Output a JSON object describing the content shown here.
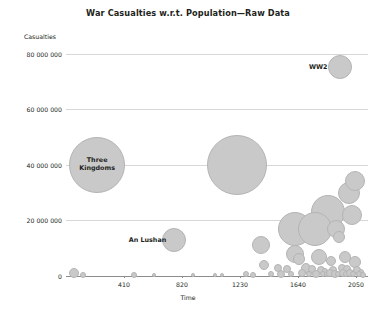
{
  "chart_data": {
    "type": "scatter",
    "title": "War Casualties w.r.t. Population—Raw Data",
    "xlabel": "Time",
    "ylabel": "Casualties",
    "xlim": [
      0,
      2135
    ],
    "ylim": [
      0,
      82000000
    ],
    "grid": true,
    "legend": "none",
    "xticks": [
      410,
      820,
      1230,
      1640,
      2050
    ],
    "xtick_labels": [
      "410",
      "820",
      "1230",
      "1640",
      "2050"
    ],
    "yticks": [
      0,
      20000000,
      40000000,
      60000000,
      80000000
    ],
    "ytick_labels": [
      "0",
      "20 000 000",
      "40 000 000",
      "60 000 000",
      "80 000 000"
    ],
    "marker": "bubble",
    "annotations": [
      {
        "label": "Three\nKingdoms",
        "x": 220,
        "y": 40000000
      },
      {
        "label": "An Lushan",
        "x": 760,
        "y": 13000000
      },
      {
        "label": "WW2",
        "x": 1939,
        "y": 75000000
      }
    ],
    "points": [
      {
        "x": 220,
        "y": 40000000,
        "r": 28,
        "name": "Three Kingdoms"
      },
      {
        "x": 1206,
        "y": 40000000,
        "r": 30,
        "name": "Mongol Conquests"
      },
      {
        "x": 1939,
        "y": 75000000,
        "r": 12,
        "name": "WW2"
      },
      {
        "x": 1850,
        "y": 23000000,
        "r": 17,
        "name": "Taiping Rebellion"
      },
      {
        "x": 1616,
        "y": 17000000,
        "r": 17,
        "name": "Qing conquest of Ming"
      },
      {
        "x": 1760,
        "y": 17000000,
        "r": 17,
        "name": "Dungan Revolt"
      },
      {
        "x": 2000,
        "y": 30000000,
        "r": 11,
        "name": "Cluster A"
      },
      {
        "x": 2040,
        "y": 34000000,
        "r": 10,
        "name": "Cluster B"
      },
      {
        "x": 2020,
        "y": 22000000,
        "r": 10,
        "name": "Cluster C"
      },
      {
        "x": 760,
        "y": 13000000,
        "r": 12,
        "name": "An Lushan"
      },
      {
        "x": 1910,
        "y": 17000000,
        "r": 9,
        "name": "WW1"
      },
      {
        "x": 1930,
        "y": 14000000,
        "r": 6,
        "name": "Russian Civil War"
      },
      {
        "x": 1620,
        "y": 8000000,
        "r": 9,
        "name": "Thirty Years War"
      },
      {
        "x": 1790,
        "y": 7000000,
        "r": 8,
        "name": "Napoleonic Wars"
      },
      {
        "x": 1650,
        "y": 6000000,
        "r": 6,
        "name": "Conquest of the Americas"
      },
      {
        "x": 1870,
        "y": 5500000,
        "r": 5,
        "name": "Colonial Wars"
      },
      {
        "x": 1975,
        "y": 7000000,
        "r": 6,
        "name": "Chinese Civil War"
      },
      {
        "x": 2045,
        "y": 5000000,
        "r": 6,
        "name": "Modern Conflict"
      },
      {
        "x": 1380,
        "y": 11000000,
        "r": 9,
        "name": "Timur"
      },
      {
        "x": 1400,
        "y": 4000000,
        "r": 5,
        "name": "Late Medieval"
      },
      {
        "x": 1500,
        "y": 3000000,
        "r": 4,
        "name": "Italian Wars"
      },
      {
        "x": 1560,
        "y": 2500000,
        "r": 4,
        "name": "French Wars of Religion"
      },
      {
        "x": 1700,
        "y": 3000000,
        "r": 5,
        "name": "War of Spanish Succession"
      },
      {
        "x": 1740,
        "y": 2500000,
        "r": 4,
        "name": "Seven Years War"
      },
      {
        "x": 1800,
        "y": 2000000,
        "r": 4,
        "name": "Latin Independence"
      },
      {
        "x": 1830,
        "y": 1800000,
        "r": 3,
        "name": "Crimean War"
      },
      {
        "x": 1890,
        "y": 2200000,
        "r": 4,
        "name": "Boxer Rebellion"
      },
      {
        "x": 1950,
        "y": 3000000,
        "r": 4,
        "name": "Korean War"
      },
      {
        "x": 1990,
        "y": 2500000,
        "r": 4,
        "name": "Vietnam War"
      },
      {
        "x": 2060,
        "y": 2000000,
        "r": 4,
        "name": "Recent Conflict"
      },
      {
        "x": 2085,
        "y": 1500000,
        "r": 3,
        "name": "Contemporary"
      },
      {
        "x": 60,
        "y": 1000000,
        "r": 5,
        "name": "Roman Wars"
      },
      {
        "x": 120,
        "y": 400000,
        "r": 3,
        "name": "Antiquity"
      },
      {
        "x": 480,
        "y": 500000,
        "r": 3,
        "name": "Migration Period"
      },
      {
        "x": 620,
        "y": 400000,
        "r": 2,
        "name": "Early Medieval"
      },
      {
        "x": 900,
        "y": 300000,
        "r": 2,
        "name": "Viking Age"
      },
      {
        "x": 1050,
        "y": 300000,
        "r": 2,
        "name": "Crusades"
      },
      {
        "x": 1100,
        "y": 300000,
        "r": 2,
        "name": "Reconquista"
      },
      {
        "x": 1270,
        "y": 600000,
        "r": 3,
        "name": "Hundred Years War"
      },
      {
        "x": 1320,
        "y": 500000,
        "r": 3,
        "name": "Medieval Conflict"
      },
      {
        "x": 1450,
        "y": 600000,
        "r": 3,
        "name": "Ottoman Wars"
      },
      {
        "x": 1520,
        "y": 800000,
        "r": 4,
        "name": "German Peasants War"
      },
      {
        "x": 1590,
        "y": 700000,
        "r": 3,
        "name": "Dutch Revolt"
      },
      {
        "x": 1670,
        "y": 900000,
        "r": 4,
        "name": "Franco-Dutch War"
      },
      {
        "x": 1720,
        "y": 700000,
        "r": 3,
        "name": "Great Northern War"
      },
      {
        "x": 1770,
        "y": 800000,
        "r": 4,
        "name": "American Revolution"
      },
      {
        "x": 1815,
        "y": 600000,
        "r": 3,
        "name": "Post-Napoleonic"
      },
      {
        "x": 1845,
        "y": 700000,
        "r": 3,
        "name": "Mexican-American War"
      },
      {
        "x": 1865,
        "y": 900000,
        "r": 4,
        "name": "American Civil War"
      },
      {
        "x": 1900,
        "y": 800000,
        "r": 4,
        "name": "Second Boer War"
      },
      {
        "x": 1925,
        "y": 600000,
        "r": 3,
        "name": "Interwar"
      },
      {
        "x": 1960,
        "y": 900000,
        "r": 4,
        "name": "Algerian War"
      },
      {
        "x": 1980,
        "y": 700000,
        "r": 3,
        "name": "Iran-Iraq War"
      },
      {
        "x": 2005,
        "y": 900000,
        "r": 4,
        "name": "Afghan War"
      },
      {
        "x": 2030,
        "y": 700000,
        "r": 3,
        "name": "Congo War"
      },
      {
        "x": 2070,
        "y": 600000,
        "r": 3,
        "name": "Syrian War"
      },
      {
        "x": 2100,
        "y": 500000,
        "r": 3,
        "name": "Other"
      }
    ]
  }
}
